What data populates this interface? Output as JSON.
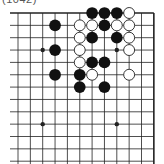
{
  "title": "(1042)",
  "board": {
    "columns_visible": 12,
    "rows_visible": 13,
    "origin_x": 18,
    "origin_y": 13,
    "spacing": 12.35,
    "edges": {
      "top": true,
      "right": true,
      "left": false,
      "bottom": false
    },
    "line_color": "#222222",
    "star_points": [
      [
        2,
        3
      ],
      [
        8,
        3
      ],
      [
        2,
        9
      ],
      [
        8,
        9
      ]
    ],
    "stones": {
      "black": [
        [
          6,
          0
        ],
        [
          7,
          0
        ],
        [
          8,
          0
        ],
        [
          3,
          1
        ],
        [
          7,
          1
        ],
        [
          6,
          2
        ],
        [
          8,
          2
        ],
        [
          3,
          3
        ],
        [
          6,
          4
        ],
        [
          7,
          4
        ],
        [
          3,
          5
        ],
        [
          5,
          5
        ],
        [
          5,
          6
        ],
        [
          7,
          6
        ]
      ],
      "white": [
        [
          9,
          0
        ],
        [
          5,
          1
        ],
        [
          6,
          1
        ],
        [
          8,
          1
        ],
        [
          9,
          1
        ],
        [
          5,
          2
        ],
        [
          9,
          2
        ],
        [
          5,
          3
        ],
        [
          9,
          3
        ],
        [
          5,
          4
        ],
        [
          6,
          5
        ],
        [
          9,
          5
        ]
      ]
    },
    "colors": {
      "black_stone": "#111111",
      "white_stone": "#ffffff",
      "white_stroke": "#222222"
    }
  }
}
